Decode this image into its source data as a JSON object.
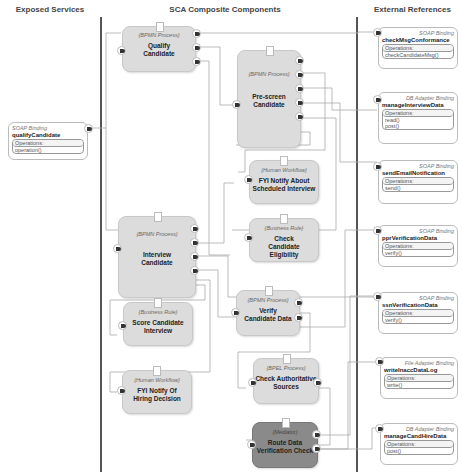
{
  "columns": {
    "exposed": "Exposed Services",
    "components": "SCA Composite Components",
    "external": "External References"
  },
  "services": [
    {
      "binding_type": "SOAP Binding",
      "name": "qualifyCandidate",
      "ops_label": "Operations:",
      "operations": [
        "operation()"
      ]
    }
  ],
  "components": [
    {
      "type": "{BPMN Process}",
      "name": "Qualify Candidate"
    },
    {
      "type": "{BPMN Process}",
      "name": "Pre-screen Candidate"
    },
    {
      "type": "{Human Workflow}",
      "name": "FYI Notify About Scheduled Interview"
    },
    {
      "type": "{Business Rule}",
      "name": "Check Candidate Eligibility"
    },
    {
      "type": "{BPMN Process}",
      "name": "Interview Candidate"
    },
    {
      "type": "{Business Rule}",
      "name": "Score Candidate Interview"
    },
    {
      "type": "{BPMN Process}",
      "name": "Verify Candidate Data"
    },
    {
      "type": "{BPEL Process}",
      "name": "Check Authoritative Sources"
    },
    {
      "type": "{Human Workflow}",
      "name": "FYI Notify Of Hiring Decision"
    },
    {
      "type": "{Mediator}",
      "name": "Route Data Verification Check"
    }
  ],
  "references": [
    {
      "binding_type": "SOAP Binding",
      "name": "checkMsgConformance",
      "ops_label": "Operations:",
      "operations": [
        "checkCandidateMsg()"
      ]
    },
    {
      "binding_type": "DB Adapter Binding",
      "name": "manageInterviewData",
      "ops_label": "Operations:",
      "operations": [
        "read()",
        "post()"
      ]
    },
    {
      "binding_type": "SOAP Binding",
      "name": "sendEmailNotification",
      "ops_label": "Operations:",
      "operations": [
        "send()"
      ]
    },
    {
      "binding_type": "SOAP Binding",
      "name": "pprVerificationData",
      "ops_label": "Operations:",
      "operations": [
        "verify()"
      ]
    },
    {
      "binding_type": "SOAP Binding",
      "name": "ssnVerificationData",
      "ops_label": "Operations:",
      "operations": [
        "verify()"
      ]
    },
    {
      "binding_type": "File Adapter Binding",
      "name": "writeInaccDataLog",
      "ops_label": "Operations:",
      "operations": [
        "write()"
      ]
    },
    {
      "binding_type": "DB Adapter Binding",
      "name": "manageCandHireData",
      "ops_label": "Operations:",
      "operations": [
        "post()"
      ]
    }
  ],
  "colors": {
    "component": "#dcdcdc",
    "mediator": "#8a8a8a",
    "divider": "#555555",
    "wire": "#aaaaaa"
  }
}
